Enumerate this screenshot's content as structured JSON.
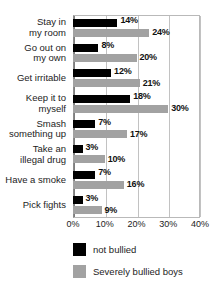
{
  "chart_data": {
    "type": "bar",
    "orientation": "horizontal",
    "title": "",
    "xlabel": "",
    "ylabel": "",
    "xlim": [
      0,
      40
    ],
    "grid": true,
    "legend_position": "bottom-left",
    "categories": [
      "Stay in my room",
      "Go out on my own",
      "Get irritable",
      "Keep it to myself",
      "Smash something up",
      "Take an illegal drug",
      "Have a smoke",
      "Pick fights"
    ],
    "category_lines": [
      [
        "Stay in",
        "my room"
      ],
      [
        "Go out on",
        "my own"
      ],
      [
        "Get irritable"
      ],
      [
        "Keep it to",
        "myself"
      ],
      [
        "Smash",
        "something up"
      ],
      [
        "Take an",
        "illegal drug"
      ],
      [
        "Have a smoke"
      ],
      [
        "Pick fights"
      ]
    ],
    "series": [
      {
        "name": "not bullied",
        "color": "#000000",
        "values": [
          14,
          8,
          12,
          18,
          7,
          3,
          7,
          3
        ],
        "labels": [
          "14%",
          "8%",
          "12%",
          "18%",
          "7%",
          "3%",
          "7%",
          "3%"
        ]
      },
      {
        "name": "Severely bullied boys",
        "color": "#a2a2a2",
        "values": [
          24,
          20,
          21,
          30,
          17,
          10,
          16,
          9
        ],
        "labels": [
          "24%",
          "20%",
          "21%",
          "30%",
          "17%",
          "10%",
          "16%",
          "9%"
        ]
      }
    ],
    "xticks": [
      0,
      10,
      20,
      30,
      40
    ],
    "xtick_labels": [
      "0%",
      "10%",
      "20%",
      "30%",
      "40%"
    ]
  },
  "legend": {
    "items": [
      {
        "label": "not bullied",
        "color": "#000000"
      },
      {
        "label": "Severely bullied boys",
        "color": "#a2a2a2"
      }
    ]
  }
}
